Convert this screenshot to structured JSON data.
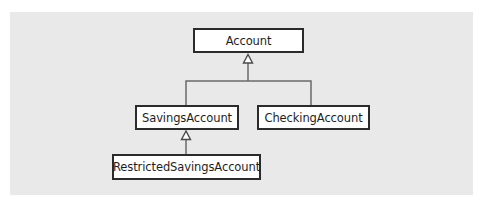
{
  "diagram": {
    "type": "uml-class-inheritance",
    "colors": {
      "background": "#ffffff",
      "panel": "#e9e9e9",
      "box_fill": "#ffffff",
      "box_border": "#2b2b2b",
      "connector": "#6a6a6a",
      "text": "#1e1e1e"
    },
    "classes": {
      "account": {
        "label": "Account"
      },
      "savings_account": {
        "label": "SavingsAccount"
      },
      "checking_account": {
        "label": "CheckingAccount"
      },
      "restricted_savings_account": {
        "label": "RestrictedSavingsAccount"
      }
    },
    "relationships": [
      {
        "type": "generalization",
        "child": "SavingsAccount",
        "parent": "Account"
      },
      {
        "type": "generalization",
        "child": "CheckingAccount",
        "parent": "Account"
      },
      {
        "type": "generalization",
        "child": "RestrictedSavingsAccount",
        "parent": "SavingsAccount"
      }
    ]
  }
}
